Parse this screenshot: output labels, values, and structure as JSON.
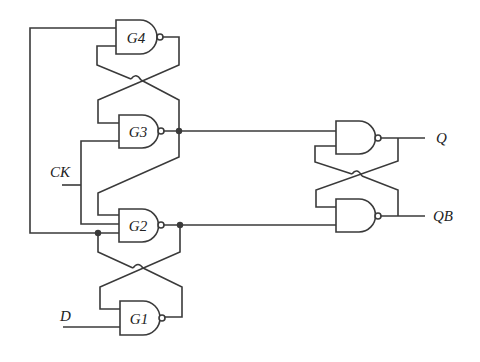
{
  "diagram": {
    "type": "circuit",
    "title": "",
    "gates": [
      {
        "id": "G4",
        "label": "G4",
        "kind": "NAND"
      },
      {
        "id": "G3",
        "label": "G3",
        "kind": "NAND"
      },
      {
        "id": "G2",
        "label": "G2",
        "kind": "NAND"
      },
      {
        "id": "G1",
        "label": "G1",
        "kind": "NAND"
      },
      {
        "id": "OUT_TOP",
        "label": "",
        "kind": "NAND"
      },
      {
        "id": "OUT_BOTTOM",
        "label": "",
        "kind": "NAND"
      }
    ],
    "signals": {
      "ck": "CK",
      "d": "D",
      "q": "Q",
      "qb": "QB"
    },
    "stroke_color": "#3a3a3a"
  }
}
